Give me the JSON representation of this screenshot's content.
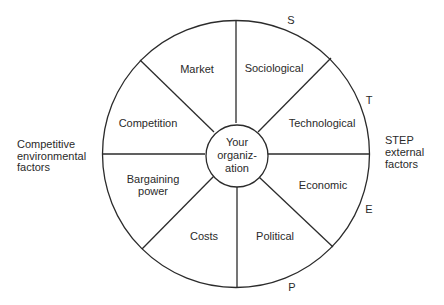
{
  "diagram": {
    "center": {
      "lines": [
        "Your",
        "organiz-",
        "ation"
      ]
    },
    "segments": [
      {
        "id": "market",
        "lines": [
          "Market"
        ]
      },
      {
        "id": "sociological",
        "lines": [
          "Sociological"
        ]
      },
      {
        "id": "technological",
        "lines": [
          "Technological"
        ]
      },
      {
        "id": "economic",
        "lines": [
          "Economic"
        ]
      },
      {
        "id": "political",
        "lines": [
          "Political"
        ]
      },
      {
        "id": "costs",
        "lines": [
          "Costs"
        ]
      },
      {
        "id": "bargaining-power",
        "lines": [
          "Bargaining",
          "power"
        ]
      },
      {
        "id": "competition",
        "lines": [
          "Competition"
        ]
      }
    ],
    "rim_letters": {
      "s": "S",
      "t": "T",
      "e": "E",
      "p": "P"
    },
    "left_caption": {
      "lines": [
        "Competitive",
        "environmental",
        "factors"
      ]
    },
    "right_caption": {
      "lines": [
        "STEP",
        "external",
        "factors"
      ]
    }
  }
}
